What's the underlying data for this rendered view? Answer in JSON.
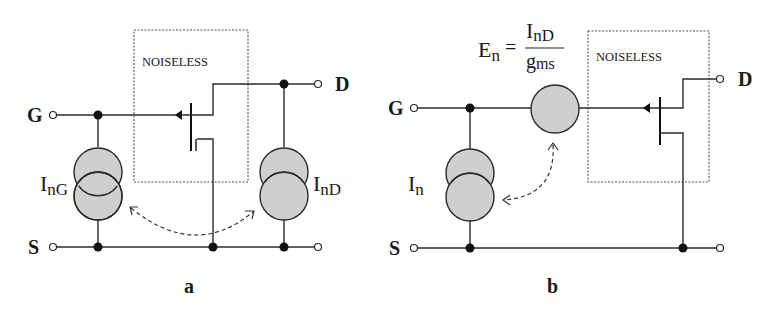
{
  "panels": [
    {
      "id": "a",
      "caption": "a",
      "box_label": "NOISELESS",
      "terminals": {
        "gate": "G",
        "drain": "D",
        "source": "S"
      },
      "sources": [
        {
          "name": "gate-noise-current",
          "label_main": "I",
          "label_sub": "nG"
        },
        {
          "name": "drain-noise-current",
          "label_main": "I",
          "label_sub": "nD"
        }
      ]
    },
    {
      "id": "b",
      "caption": "b",
      "box_label": "NOISELESS",
      "terminals": {
        "gate": "G",
        "drain": "D",
        "source": "S"
      },
      "current_source": {
        "label_main": "I",
        "label_sub": "n"
      },
      "voltage_source": {
        "lhs_main": "E",
        "lhs_sub": "n",
        "equals": "=",
        "num_main": "I",
        "num_sub": "nD",
        "den_main": "g",
        "den_sub": "ms"
      }
    }
  ],
  "colors": {
    "wire": "#2a2a2a",
    "source_fill": "#cfcfcf",
    "box_dash": "#555555",
    "background": "#ffffff"
  }
}
